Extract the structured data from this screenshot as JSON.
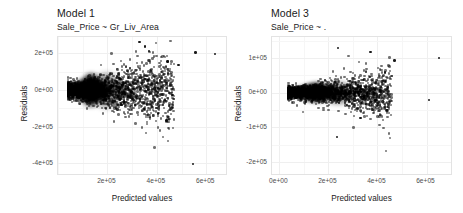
{
  "figure": {
    "background": "#ffffff",
    "point_color": "#000000",
    "grid_color": "#efefef",
    "panel_border_color": "#e3e3e3"
  },
  "chart_data": [
    {
      "type": "scatter",
      "id": "model-1",
      "title": "Model 1",
      "subtitle": "Sale_Price ~ Gr_Liv_Area",
      "xlabel": "Predicted values",
      "ylabel": "Residuals",
      "grid": true,
      "legend": "none",
      "xlim": [
        0,
        680000
      ],
      "ylim": [
        -460000,
        290000
      ],
      "xticks": [
        "2e+05",
        "4e+05",
        "6e+05"
      ],
      "xtick_values": [
        200000,
        400000,
        600000
      ],
      "yticks": [
        "2e+05",
        "0e+00",
        "-2e+05",
        "-4e+05"
      ],
      "ytick_values": [
        200000,
        0,
        -200000,
        -400000
      ],
      "n_points": 2930,
      "description": "Residuals vs predicted values for a simple linear model; dense wedge-shaped cloud widening with larger predictions (heteroscedastic fan), with scattered high outliers above +2e+05 and one low outlier near -4e+05.",
      "outliers": [
        {
          "x": 330000,
          "y": 262000
        },
        {
          "x": 352000,
          "y": 237000
        },
        {
          "x": 368000,
          "y": 214000
        },
        {
          "x": 556000,
          "y": 205000
        },
        {
          "x": 636000,
          "y": 198000
        },
        {
          "x": 444000,
          "y": 155000
        },
        {
          "x": 487000,
          "y": 138000
        },
        {
          "x": 404000,
          "y": -128000
        },
        {
          "x": 440000,
          "y": -167000
        },
        {
          "x": 546000,
          "y": -404000
        }
      ]
    },
    {
      "type": "scatter",
      "id": "model-3",
      "title": "Model 3",
      "subtitle": "Sale_Price ~ .",
      "xlabel": "Predicted values",
      "ylabel": "Residuals",
      "grid": true,
      "legend": "none",
      "xlim": [
        -30000,
        700000
      ],
      "ylim": [
        -235000,
        160000
      ],
      "xticks": [
        "0e+00",
        "2e+05",
        "4e+05",
        "6e+05"
      ],
      "xtick_values": [
        0,
        200000,
        400000,
        600000
      ],
      "yticks": [
        "1e+05",
        "0e+00",
        "-1e+05",
        "-2e+05"
      ],
      "ytick_values": [
        100000,
        0,
        -100000,
        -200000
      ],
      "n_points": 2930,
      "description": "Residuals vs predicted values for the full model; a much tighter horizontal band centred on zero with modest spread, a few high and low outliers at larger predictions.",
      "outliers": [
        {
          "x": 240000,
          "y": 128000
        },
        {
          "x": 372000,
          "y": 117000
        },
        {
          "x": 652000,
          "y": 100000
        },
        {
          "x": 470000,
          "y": 92000
        },
        {
          "x": 430000,
          "y": 58000
        },
        {
          "x": 610000,
          "y": -22000
        },
        {
          "x": 236000,
          "y": -128000
        },
        {
          "x": 330000,
          "y": -74000
        }
      ]
    }
  ]
}
